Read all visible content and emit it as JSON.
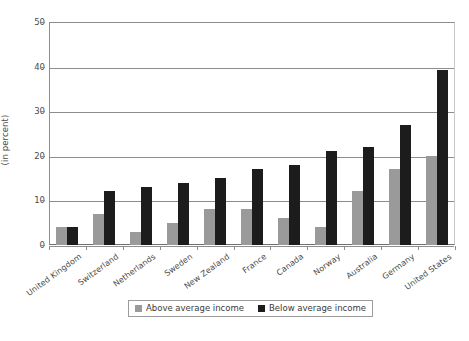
{
  "chart_data": {
    "type": "bar",
    "title": "",
    "subtitle": "",
    "xlabel": "",
    "ylabel": "(in percent)",
    "ylim": [
      0,
      50
    ],
    "yticks": [
      0,
      10,
      20,
      30,
      40,
      50
    ],
    "ytick_labels": [
      "0",
      "10",
      "20",
      "30",
      "40",
      "50"
    ],
    "grid": true,
    "grid_axis": "y",
    "legend_position": "bottom-center",
    "categories": [
      "United Kingdom",
      "Switzerland",
      "Netherlands",
      "Sweden",
      "New Zealand",
      "France",
      "Canada",
      "Norway",
      "Australia",
      "Germany",
      "United States"
    ],
    "series": [
      {
        "name": "Above average income",
        "color": "#9a9a9a",
        "values": [
          4,
          7,
          3,
          5,
          8,
          8,
          6,
          4,
          12,
          17,
          20
        ]
      },
      {
        "name": "Below average income",
        "color": "#1c1c1c",
        "values": [
          4,
          12,
          13,
          14,
          15,
          17,
          18,
          21,
          22,
          27,
          39.3
        ]
      }
    ]
  },
  "legend": {
    "entries": [
      {
        "label": "Above average income",
        "color": "#9a9a9a"
      },
      {
        "label": "Below average income",
        "color": "#1c1c1c"
      }
    ]
  },
  "colors": {
    "above_average": "#9a9a9a",
    "below_average": "#1c1c1c",
    "gridline": "#8d8d8d",
    "axis": "#6f6f6f",
    "text": "#4a4a4a",
    "background": "#ffffff"
  }
}
